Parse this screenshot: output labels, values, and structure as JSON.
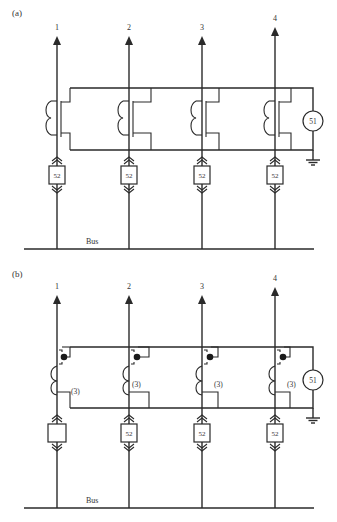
{
  "panels": [
    {
      "label": "(a)",
      "feeders": [
        {
          "label": "1",
          "breaker": "52"
        },
        {
          "label": "2",
          "breaker": "52"
        },
        {
          "label": "3",
          "breaker": "52"
        },
        {
          "label": "4",
          "breaker": "52"
        }
      ],
      "relay_label": "51",
      "bus_label": "Bus"
    },
    {
      "label": "(b)",
      "feeders": [
        {
          "label": "1",
          "breaker": "",
          "ct_note": "(3)"
        },
        {
          "label": "2",
          "breaker": "52",
          "ct_note": "(3)"
        },
        {
          "label": "3",
          "breaker": "52",
          "ct_note": "(3)"
        },
        {
          "label": "4",
          "breaker": "52",
          "ct_note": "(3)"
        }
      ],
      "relay_label": "51",
      "bus_label": "Bus"
    }
  ]
}
